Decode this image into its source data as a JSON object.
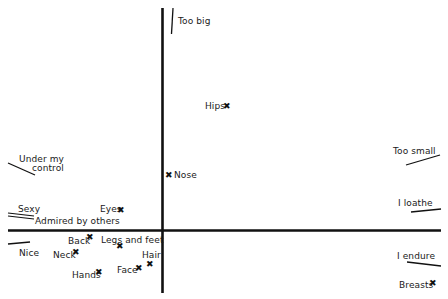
{
  "axes": {
    "vertical": {
      "top_label": "Too big",
      "bottom_label": ""
    },
    "horizontal": {
      "left_label": "",
      "right_label": ""
    }
  },
  "scale_labels": {
    "too_big": "Too big",
    "too_small": "Too small",
    "i_loathe": "I loathe",
    "i_endure": "I endure",
    "under_my_control_1": "Under my",
    "under_my_control_2": "control",
    "sexy": "Sexy",
    "admired_by_others": "Admired by others",
    "nice": "Nice"
  },
  "points": [
    {
      "label": "Hips",
      "x": 227,
      "y": 106
    },
    {
      "label": "Nose",
      "x": 169,
      "y": 175
    },
    {
      "label": "Eyes",
      "x": 121,
      "y": 210
    },
    {
      "label": "Back",
      "x": 90,
      "y": 237
    },
    {
      "label": "Legs and feet",
      "x": 120,
      "y": 246
    },
    {
      "label": "Neck",
      "x": 76,
      "y": 252
    },
    {
      "label": "Hair",
      "x": 150,
      "y": 264
    },
    {
      "label": "Face",
      "x": 139,
      "y": 268
    },
    {
      "label": "Hands",
      "x": 99,
      "y": 272
    },
    {
      "label": "Breasts",
      "x": 433,
      "y": 283
    }
  ],
  "marker_glyph": "✖"
}
